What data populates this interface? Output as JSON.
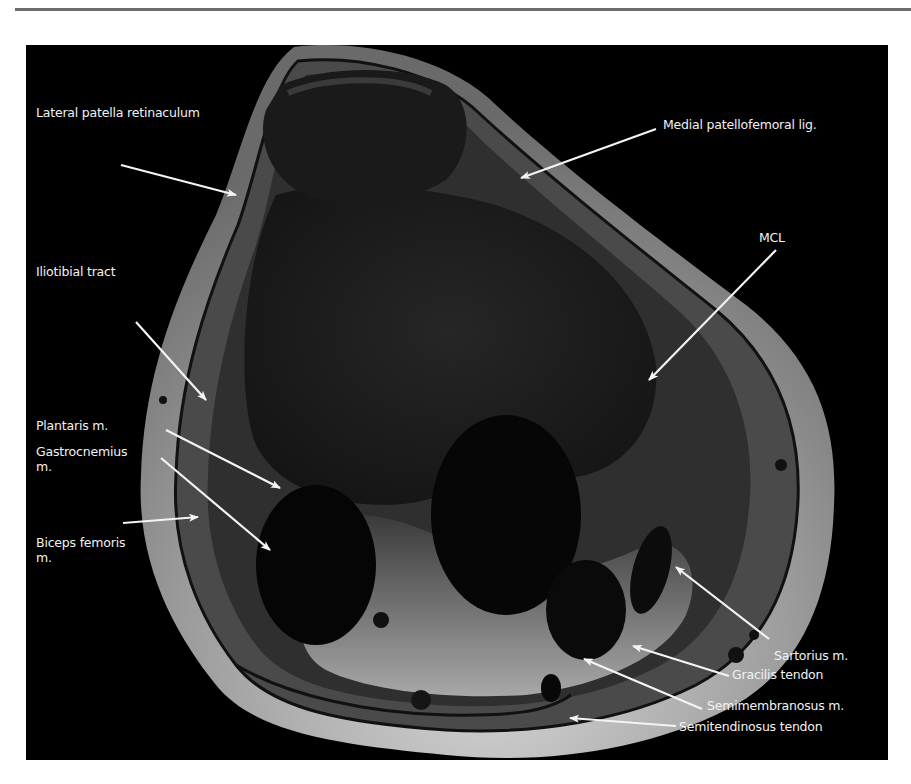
{
  "figure": {
    "background_color": "#000000",
    "label_color": "#f2f2f2",
    "labels": [
      {
        "id": "lateral-patella-retinaculum",
        "text": "Lateral patella retinaculum",
        "x": 10,
        "y": 60
      },
      {
        "id": "medial-patellofemoral-lig",
        "text": "Medial patellofemoral lig.",
        "x": 637,
        "y": 72
      },
      {
        "id": "mcl",
        "text": "MCL",
        "x": 733,
        "y": 185
      },
      {
        "id": "iliotibial-tract",
        "text": "Iliotibial tract",
        "x": 10,
        "y": 219
      },
      {
        "id": "plantaris-m",
        "text": "Plantaris m.",
        "x": 10,
        "y": 373
      },
      {
        "id": "gastrocnemius-m",
        "text": "Gastrocnemius\nm.",
        "x": 10,
        "y": 399
      },
      {
        "id": "biceps-femoris-m",
        "text": "Biceps femoris\nm.",
        "x": 10,
        "y": 490
      },
      {
        "id": "sartorius-m",
        "text": "Sartorius m.",
        "x": 748,
        "y": 603
      },
      {
        "id": "gracilis-tendon",
        "text": "Gracilis tendon",
        "x": 706,
        "y": 622
      },
      {
        "id": "semimembranosus-m",
        "text": "Semimembranosus m.",
        "x": 681,
        "y": 653
      },
      {
        "id": "semitendinosus-tendon",
        "text": "Semitendinosus tendon",
        "x": 653,
        "y": 674
      }
    ]
  }
}
